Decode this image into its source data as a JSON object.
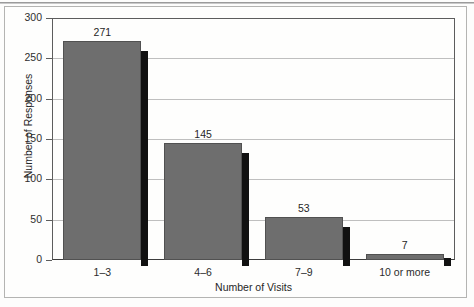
{
  "chart_data": {
    "type": "bar",
    "title": "",
    "subtitle": "",
    "xlabel": "Number of Visits",
    "ylabel": "Number of Responses",
    "categories": [
      "1–3",
      "4–6",
      "7–9",
      "10 or more"
    ],
    "values": [
      271,
      145,
      53,
      7
    ],
    "value_labels": [
      "271",
      "145",
      "53",
      "7"
    ],
    "ylim": [
      0,
      300
    ],
    "yticks": [
      0,
      50,
      100,
      150,
      200,
      250,
      300
    ],
    "ytick_labels": [
      "0",
      "50",
      "100",
      "150",
      "200",
      "250",
      "300"
    ],
    "grid": "horizontal",
    "legend": "none",
    "bar_color": "#6e6e6e",
    "bar_edge_color": "#515151",
    "bar_shadow_color": "#111111",
    "gridline_color": "#bfbfbf",
    "axis_color": "#5d5d5d",
    "background_color": "#fefefd",
    "annotations": []
  },
  "figure": {
    "page_background": "#fdfdfc",
    "border_color": "#b4b4b2"
  }
}
